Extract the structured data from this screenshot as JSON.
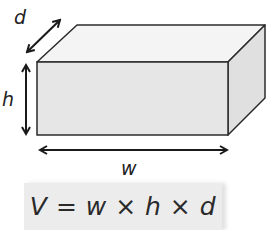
{
  "diagram": {
    "labels": {
      "depth": "d",
      "height": "h",
      "width": "w"
    },
    "colors": {
      "front_face": "#e6e6e6",
      "top_face": "#f4f4f4",
      "side_face": "#dcdcdc",
      "edge": "#2b2b2b",
      "formula_bg": "#ececec"
    }
  },
  "formula": {
    "text": "V = w × h × d"
  }
}
